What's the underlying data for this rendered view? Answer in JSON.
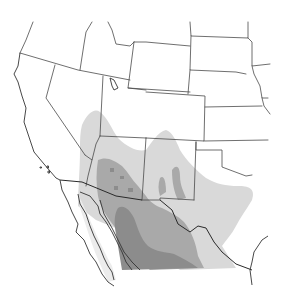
{
  "map": {
    "type": "species-range-map",
    "region": "Southwestern United States and northern Mexico",
    "background": "#ffffff",
    "range_layers": [
      {
        "name": "range-outer",
        "color": "#d9d9d9"
      },
      {
        "name": "range-middle",
        "color": "#a9a9a9"
      },
      {
        "name": "range-core",
        "color": "#8c8c8c"
      }
    ],
    "baja_fill": "#ececec",
    "border_color": "#4a4a4a"
  }
}
